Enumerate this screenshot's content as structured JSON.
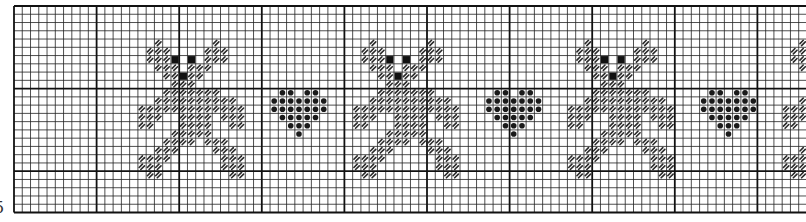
{
  "chart": {
    "edge_label": "5",
    "grid": {
      "origin_x": 14,
      "origin_y": 6,
      "cell": 8.26,
      "cols": 96,
      "rows": 25,
      "major_every": 10,
      "minor_color": "#222222",
      "major_color": "#111111",
      "background": "#ffffff"
    },
    "symbols": {
      "stitch": {
        "name": "diagonal-hatch-stitch",
        "color": "#2a2a2a"
      },
      "eye": {
        "name": "solid-black-square",
        "color": "#111111"
      },
      "heart": {
        "name": "solid-dot",
        "color": "#1a1a1a"
      }
    },
    "motifs": {
      "bear": {
        "stitch_rows": [
          "..X......X...",
          ".XXX....XXX..",
          ".XXXE.E.XXX..",
          "..XXX.XXX....",
          "...XXEXX.....",
          "....XXX......",
          "...XXXXXXX...",
          "..XXXXXXXXXX.",
          "XXXXXXXXXXXXX",
          "XXX..XXXX.XXX",
          "XX...XXXX..XX",
          "....XXXXX....",
          "...XXXX.XXX..",
          "..XXX....XXX.",
          "XXXX......XXX",
          "XXX.......XXX",
          ".XX........XX"
        ]
      },
      "heart": {
        "dot_rows": [
          ".XX.XX.",
          "XXXXXXX",
          "XXXXXXX",
          ".XXXXX.",
          "..XXX..",
          "...X..."
        ]
      }
    },
    "placements": [
      {
        "motif": "bear",
        "col": 15,
        "row": 4
      },
      {
        "motif": "heart",
        "col": 31,
        "row": 10
      },
      {
        "motif": "bear",
        "col": 41,
        "row": 4
      },
      {
        "motif": "heart",
        "col": 57,
        "row": 10
      },
      {
        "motif": "bear",
        "col": 67,
        "row": 4
      },
      {
        "motif": "heart",
        "col": 83,
        "row": 10
      },
      {
        "motif": "bear",
        "col": 93,
        "row": 4
      }
    ]
  }
}
